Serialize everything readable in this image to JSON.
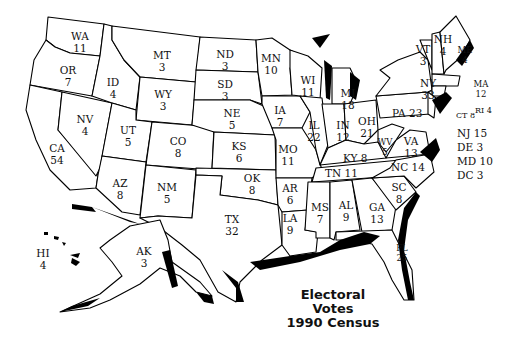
{
  "title": {
    "line1": "Electoral",
    "line2": "Votes",
    "line3": "1990 Census"
  },
  "states": {
    "WA": {
      "abbr": "WA",
      "votes": "11"
    },
    "OR": {
      "abbr": "OR",
      "votes": "7"
    },
    "CA": {
      "abbr": "CA",
      "votes": "54"
    },
    "NV": {
      "abbr": "NV",
      "votes": "4"
    },
    "ID": {
      "abbr": "ID",
      "votes": "4"
    },
    "MT": {
      "abbr": "MT",
      "votes": "3"
    },
    "WY": {
      "abbr": "WY",
      "votes": "3"
    },
    "UT": {
      "abbr": "UT",
      "votes": "5"
    },
    "AZ": {
      "abbr": "AZ",
      "votes": "8"
    },
    "CO": {
      "abbr": "CO",
      "votes": "8"
    },
    "NM": {
      "abbr": "NM",
      "votes": "5"
    },
    "ND": {
      "abbr": "ND",
      "votes": "3"
    },
    "SD": {
      "abbr": "SD",
      "votes": "3"
    },
    "NE": {
      "abbr": "NE",
      "votes": "5"
    },
    "KS": {
      "abbr": "KS",
      "votes": "6"
    },
    "OK": {
      "abbr": "OK",
      "votes": "8"
    },
    "TX": {
      "abbr": "TX",
      "votes": "32"
    },
    "MN": {
      "abbr": "MN",
      "votes": "10"
    },
    "IA": {
      "abbr": "IA",
      "votes": "7"
    },
    "MO": {
      "abbr": "MO",
      "votes": "11"
    },
    "AR": {
      "abbr": "AR",
      "votes": "6"
    },
    "LA": {
      "abbr": "LA",
      "votes": "9"
    },
    "WI": {
      "abbr": "WI",
      "votes": "11"
    },
    "IL": {
      "abbr": "IL",
      "votes": "22"
    },
    "MI": {
      "abbr": "MI",
      "votes": "18"
    },
    "IN": {
      "abbr": "IN",
      "votes": "12"
    },
    "OH": {
      "abbr": "OH",
      "votes": "21"
    },
    "KY": {
      "abbr": "KY",
      "votes": "8"
    },
    "TN": {
      "abbr": "TN",
      "votes": "11"
    },
    "MS": {
      "abbr": "MS",
      "votes": "7"
    },
    "AL": {
      "abbr": "AL",
      "votes": "9"
    },
    "GA": {
      "abbr": "GA",
      "votes": "13"
    },
    "FL": {
      "abbr": "FL",
      "votes": "25"
    },
    "SC": {
      "abbr": "SC",
      "votes": "8"
    },
    "NC": {
      "abbr": "NC",
      "votes": "14"
    },
    "VA": {
      "abbr": "VA",
      "votes": "13"
    },
    "WV": {
      "abbr": "WV",
      "votes": "5"
    },
    "PA": {
      "abbr": "PA",
      "votes": "23"
    },
    "NY": {
      "abbr": "NY",
      "votes": "33"
    },
    "VT": {
      "abbr": "VT",
      "votes": "3"
    },
    "NH": {
      "abbr": "NH",
      "votes": "4"
    },
    "ME": {
      "abbr": "ME",
      "votes": "4"
    },
    "MA": {
      "abbr": "MA",
      "votes": "12"
    },
    "RI": {
      "abbr": "RI",
      "votes": "4"
    },
    "CT": {
      "abbr": "CT",
      "votes": "8"
    },
    "NJ": {
      "abbr": "NJ",
      "votes": "15"
    },
    "DE": {
      "abbr": "DE",
      "votes": "3"
    },
    "MD": {
      "abbr": "MD",
      "votes": "10"
    },
    "DC": {
      "abbr": "DC",
      "votes": "3"
    },
    "AK": {
      "abbr": "AK",
      "votes": "3"
    },
    "HI": {
      "abbr": "HI",
      "votes": "4"
    }
  },
  "inline_labels": {
    "PA": "PA 23",
    "KY": "KY 8",
    "TN": "TN 11",
    "NC": "NC 14",
    "RI": "RI 4",
    "CT": "CT 8",
    "NJ": "NJ 15",
    "DE": "DE 3",
    "MD": "MD 10",
    "DC": "DC 3"
  }
}
